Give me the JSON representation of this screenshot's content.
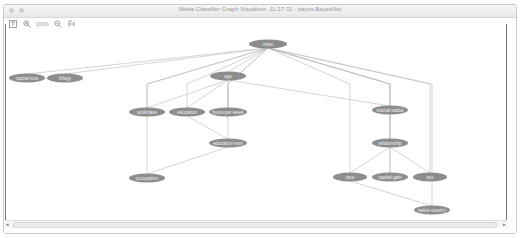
{
  "window": {
    "title": "Weka Classifier Graph Visualizer: 11:37:31 - bayes.BayesNet"
  },
  "toolbar": {
    "fit_icon": "fit-to-window-icon",
    "zoom_in_icon": "zoom-in-icon",
    "zoom_level": "100%",
    "zoom_out_icon": "zoom-out-icon",
    "layout_icon": "layout-icon"
  },
  "graph": {
    "node_color": "#8d8d8d",
    "edge_color": "#b8b8b8",
    "nodes": [
      {
        "id": "class",
        "label": "class",
        "x": 268,
        "y": 44,
        "w": 38
      },
      {
        "id": "capital-loss",
        "label": "capital-loss",
        "x": 27,
        "y": 78,
        "w": 36
      },
      {
        "id": "fnlwgt",
        "label": "fnlwgt",
        "x": 65,
        "y": 78,
        "w": 36
      },
      {
        "id": "age",
        "label": "age",
        "x": 228,
        "y": 76,
        "w": 36
      },
      {
        "id": "workclass",
        "label": "workclass",
        "x": 147,
        "y": 112,
        "w": 36
      },
      {
        "id": "education",
        "label": "education",
        "x": 187,
        "y": 112,
        "w": 36
      },
      {
        "id": "hours-per-week",
        "label": "hours-per-week",
        "x": 228,
        "y": 112,
        "w": 38
      },
      {
        "id": "education-num",
        "label": "education-num",
        "x": 228,
        "y": 143,
        "w": 38
      },
      {
        "id": "occupation",
        "label": "occupation",
        "x": 147,
        "y": 178,
        "w": 36
      },
      {
        "id": "marital-status",
        "label": "marital-status",
        "x": 390,
        "y": 110,
        "w": 36
      },
      {
        "id": "relationship",
        "label": "relationship",
        "x": 390,
        "y": 143,
        "w": 36
      },
      {
        "id": "race",
        "label": "race",
        "x": 350,
        "y": 177,
        "w": 34
      },
      {
        "id": "capital-gain",
        "label": "capital-gain",
        "x": 390,
        "y": 177,
        "w": 36
      },
      {
        "id": "sex",
        "label": "sex",
        "x": 430,
        "y": 177,
        "w": 34
      },
      {
        "id": "native-country",
        "label": "native-country",
        "x": 432,
        "y": 210,
        "w": 36
      }
    ],
    "edges": [
      {
        "from": "class",
        "to": "capital-loss"
      },
      {
        "from": "class",
        "to": "fnlwgt"
      },
      {
        "from": "class",
        "to": "age"
      },
      {
        "from": "class",
        "to": "workclass"
      },
      {
        "from": "class",
        "to": "education"
      },
      {
        "from": "class",
        "to": "hours-per-week"
      },
      {
        "from": "class",
        "to": "education-num"
      },
      {
        "from": "class",
        "to": "occupation"
      },
      {
        "from": "class",
        "to": "marital-status"
      },
      {
        "from": "class",
        "to": "relationship"
      },
      {
        "from": "class",
        "to": "race"
      },
      {
        "from": "class",
        "to": "capital-gain"
      },
      {
        "from": "class",
        "to": "sex"
      },
      {
        "from": "class",
        "to": "native-country"
      },
      {
        "from": "age",
        "to": "workclass"
      },
      {
        "from": "age",
        "to": "education"
      },
      {
        "from": "age",
        "to": "hours-per-week"
      },
      {
        "from": "age",
        "to": "marital-status"
      },
      {
        "from": "education",
        "to": "education-num"
      },
      {
        "from": "education-num",
        "to": "occupation"
      },
      {
        "from": "marital-status",
        "to": "relationship"
      },
      {
        "from": "relationship",
        "to": "race"
      },
      {
        "from": "relationship",
        "to": "capital-gain"
      },
      {
        "from": "relationship",
        "to": "sex"
      },
      {
        "from": "race",
        "to": "native-country"
      }
    ]
  }
}
